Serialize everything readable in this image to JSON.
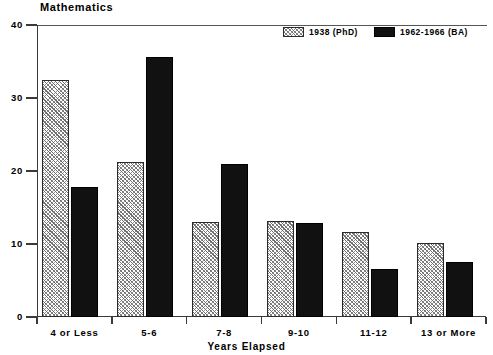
{
  "chart_data": {
    "type": "bar",
    "title": "Mathematics",
    "xlabel": "Years Elapsed",
    "ylabel": "Percent",
    "ylim": [
      0,
      40
    ],
    "yticks": [
      0,
      10,
      20,
      30,
      40
    ],
    "ytick_labels": [
      "0",
      "10",
      "20",
      "30",
      "40"
    ],
    "grid": false,
    "legend_position": "top-right",
    "categories": [
      "4 or Less",
      "5-6",
      "7-8",
      "9-10",
      "11-12",
      "13 or More"
    ],
    "series": [
      {
        "name": "1938 (PhD)",
        "fill": "hatched",
        "values": [
          32.4,
          21.2,
          13.0,
          13.1,
          11.6,
          10.1
        ]
      },
      {
        "name": "1962-1966 (BA)",
        "fill": "solid",
        "values": [
          17.8,
          35.6,
          21.0,
          12.9,
          6.6,
          7.5
        ]
      }
    ]
  },
  "colors": {
    "axis": "#3a3a3a",
    "solid_bar": "#111111",
    "hatch_line": "#6e6e6e",
    "background": "#ffffff"
  }
}
